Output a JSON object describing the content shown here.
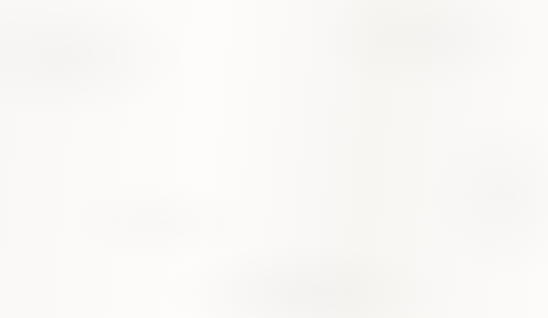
{
  "chart_data": {
    "type": "bar",
    "title": "Religion of Members of Congress",
    "xlabel": "Religion",
    "ylabel": "Number",
    "categories": [
      "Protestant",
      "Catholic",
      "Jewish",
      "Mormon",
      "Other"
    ],
    "values": [
      302,
      153,
      37,
      12,
      12
    ],
    "ylim": [
      0,
      350
    ],
    "ytick_labels": [
      "350",
      "300",
      "250",
      "200",
      "150",
      "100",
      "50",
      "0"
    ],
    "ytick_values": [
      350,
      300,
      250,
      200,
      150,
      100,
      50,
      0
    ],
    "ytick_step": 50,
    "grid": true,
    "grid_axis": "y",
    "legend": null,
    "legend_position": "none",
    "bar_color": "#0d0d0d",
    "grid_color": "#d4d2d0",
    "text_color": "#1e1e1e",
    "background_color": "#fbfaf9",
    "border_color": "#cfcdcb",
    "series": [
      {
        "name": "Number",
        "values": [
          302,
          153,
          37,
          12,
          12
        ]
      }
    ]
  }
}
